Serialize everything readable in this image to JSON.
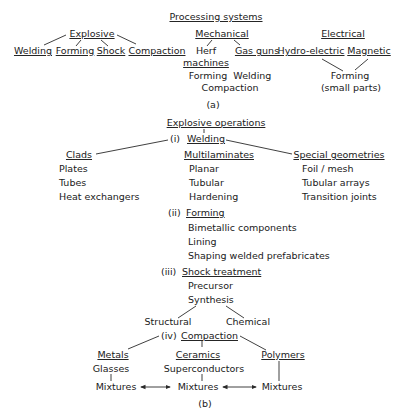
{
  "part_a": {
    "title": "Processing systems",
    "label": "(a)",
    "explosive": {
      "heading": "Explosive",
      "children": [
        "Welding",
        "Forming",
        "Shock",
        "Compaction"
      ]
    },
    "mechanical": {
      "heading": "Mechanical",
      "children": [
        "Herf",
        "Gas guns"
      ],
      "herf_line2": "machines",
      "applications": [
        "Forming  Welding",
        "Compaction"
      ]
    },
    "electrical": {
      "heading": "Electrical",
      "children": [
        "Hydro-electric",
        "Magnetic"
      ],
      "result": [
        "Forming",
        "(small parts)"
      ]
    }
  },
  "part_b": {
    "title": "Explosive operations",
    "label": "(b)",
    "welding": {
      "prefix": "(i)",
      "heading": "Welding",
      "clads": {
        "heading": "Clads",
        "items": [
          "Plates",
          "Tubes",
          "Heat exchangers"
        ]
      },
      "multilaminates": {
        "heading": "Multilaminates",
        "items": [
          "Planar",
          "Tubular",
          "Hardening"
        ]
      },
      "special": {
        "heading": "Special geometries",
        "items": [
          "Foil / mesh",
          "Tubular arrays",
          "Transition joints"
        ]
      }
    },
    "forming": {
      "prefix": "(ii)",
      "heading": "Forming",
      "items": [
        "Bimetallic components",
        "Lining",
        "Shaping welded prefabricates"
      ]
    },
    "shock": {
      "prefix": "(iii)",
      "heading": "Shock treatment",
      "items": [
        "Precursor",
        "Synthesis"
      ],
      "synthesis_children": [
        "Structural",
        "Chemical"
      ]
    },
    "compaction": {
      "prefix": "(iv)",
      "heading": "Compaction",
      "metals": {
        "heading": "Metals",
        "sub": "Glasses",
        "result": "Mixtures"
      },
      "ceramics": {
        "heading": "Ceramics",
        "sub": "Superconductors",
        "result": "Mixtures"
      },
      "polymers": {
        "heading": "Polymers",
        "result": "Mixtures"
      }
    }
  }
}
